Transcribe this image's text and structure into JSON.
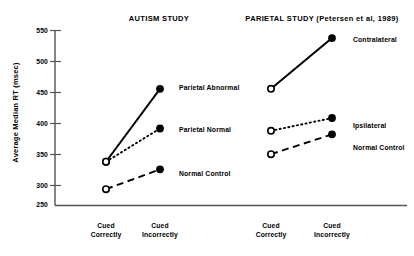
{
  "figure": {
    "ylabel": "Average Median RT (msec)",
    "panels": [
      {
        "key": "autism",
        "title": "AUTISM STUDY",
        "xticks": [
          {
            "line1": "Cued",
            "line2": "Correctly"
          },
          {
            "line1": "Cued",
            "line2": "Incorrectly"
          }
        ],
        "series": [
          {
            "name": "Parietal Abnormal",
            "label": "Parietal Abnormal",
            "style": "solid",
            "values": [
              325,
              450
            ]
          },
          {
            "name": "Parietal Normal",
            "label": "Parietal Normal",
            "style": "dotted",
            "values": [
              325,
              382
            ]
          },
          {
            "name": "Normal Control",
            "label": "Normal Control",
            "style": "dashed",
            "values": [
              278,
              312
            ]
          }
        ]
      },
      {
        "key": "parietal",
        "title": "PARIETAL STUDY (Petersen et al, 1989)",
        "xticks": [
          {
            "line1": "Cued",
            "line2": "Correctly"
          },
          {
            "line1": "Cued",
            "line2": "Incorrectly"
          }
        ],
        "series": [
          {
            "name": "Contralateral",
            "label": "Contralateral",
            "style": "solid",
            "values": [
              450,
              537
            ]
          },
          {
            "name": "Ipsilateral",
            "label": "Ipsilateral",
            "style": "dotted",
            "values": [
              378,
              400
            ]
          },
          {
            "name": "Normal Control",
            "label": "Normal Control",
            "style": "dashed",
            "values": [
              338,
              372
            ]
          }
        ]
      }
    ],
    "yaxis": {
      "ticks": [
        "550",
        "500",
        "450",
        "400",
        "350",
        "300",
        "250"
      ],
      "min": 250,
      "max": 550
    },
    "colors": {
      "axis": "#555555",
      "ink": "#000000",
      "background": "#ffffff"
    }
  },
  "chart_data": {
    "type": "line",
    "xlabel": "",
    "ylabel": "Average Median RT (msec)",
    "ylim": [
      250,
      550
    ],
    "yticks": [
      250,
      300,
      350,
      400,
      450,
      500,
      550
    ],
    "grid": false,
    "legend": "inline-point-labels",
    "panels": [
      {
        "title": "AUTISM STUDY",
        "categories": [
          "Cued Correctly",
          "Cued Incorrectly"
        ],
        "series": [
          {
            "name": "Parietal Abnormal",
            "values": [
              325,
              450
            ],
            "marker": "filled-circle",
            "line": "solid"
          },
          {
            "name": "Parietal Normal",
            "values": [
              325,
              382
            ],
            "marker": "filled-circle",
            "line": "dotted"
          },
          {
            "name": "Normal Control",
            "values": [
              278,
              312
            ],
            "marker": "filled-circle",
            "line": "dashed"
          }
        ],
        "start_marker": "open-circle"
      },
      {
        "title": "PARIETAL STUDY (Petersen et al, 1989)",
        "categories": [
          "Cued Correctly",
          "Cued Incorrectly"
        ],
        "series": [
          {
            "name": "Contralateral",
            "values": [
              450,
              537
            ],
            "marker": "filled-circle",
            "line": "solid"
          },
          {
            "name": "Ipsilateral",
            "values": [
              378,
              400
            ],
            "marker": "filled-circle",
            "line": "dotted"
          },
          {
            "name": "Normal Control",
            "values": [
              338,
              372
            ],
            "marker": "filled-circle",
            "line": "dashed"
          }
        ],
        "start_marker": "open-circle"
      }
    ]
  }
}
